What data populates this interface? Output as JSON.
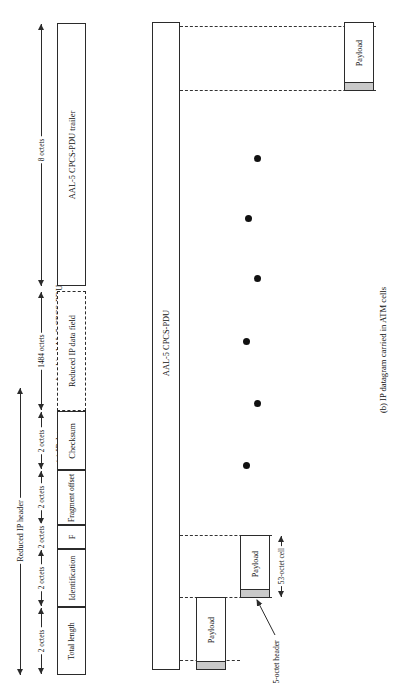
{
  "figure": {
    "panel_a": {
      "caption": "(a) IP datagram encapsulated in AAL-5 CPCS-PDU",
      "overall_bracket_label": "Reduced IP header",
      "header_fields": [
        {
          "label": "Total length",
          "size_label": "2 octets"
        },
        {
          "label": "Identification",
          "size_label": "2 octets"
        },
        {
          "label": "F",
          "size_label": "2 octets"
        },
        {
          "label": "Fragment offset",
          "size_label": "2 octets"
        },
        {
          "label": "Checksum",
          "size_label": "2 octets"
        }
      ],
      "data_field": {
        "label": "Reduced IP data field",
        "size_label": "1484 octets"
      },
      "trailer": {
        "label": "AAL-5 CPCS-PDU trailer",
        "size_label": "8 octets"
      }
    },
    "panel_b": {
      "caption": "(b) IP datagram carried in ATM cells",
      "pdu_label": "AAL-5 CPCS-PDU",
      "cells": [
        {
          "payload_label": "Payload"
        },
        {
          "payload_label": "Payload"
        },
        {
          "payload_label": "Payload"
        }
      ],
      "cell_size_label": "53-octet cell",
      "header_callout_label": "5-octet header",
      "ellipsis_dots": 5
    }
  },
  "colors": {
    "stroke": "#2b2b2b",
    "header_fill": "#c9c9c9",
    "background": "#ffffff"
  }
}
